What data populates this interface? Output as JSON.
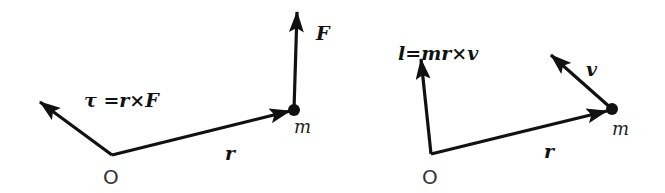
{
  "diagram": {
    "colors": {
      "ink": "#111111",
      "background": "#ffffff"
    },
    "left": {
      "origin_label": "O",
      "position_label": "r",
      "mass_label": "m",
      "force_label": "F",
      "torque_label": "τ =r×F"
    },
    "right": {
      "origin_label": "O",
      "position_label": "r",
      "mass_label": "m",
      "velocity_label": "v",
      "angular_momentum_label": "l=mr×v"
    }
  }
}
